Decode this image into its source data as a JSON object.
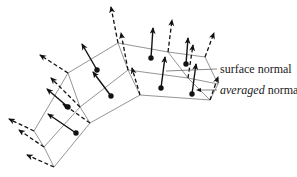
{
  "labels": {
    "surface_normal": "surface normal",
    "averaged_word": "averaged",
    "normal_word": "normal"
  },
  "colors": {
    "background": "#ffffff",
    "mesh_line": "#7a7a7a",
    "arrow": "#111111",
    "text": "#1a1a1a"
  },
  "legend": [
    {
      "name": "surface normal",
      "style": "solid arrow from face center"
    },
    {
      "name": "averaged normal",
      "style": "dashed arrow from vertex"
    }
  ]
}
